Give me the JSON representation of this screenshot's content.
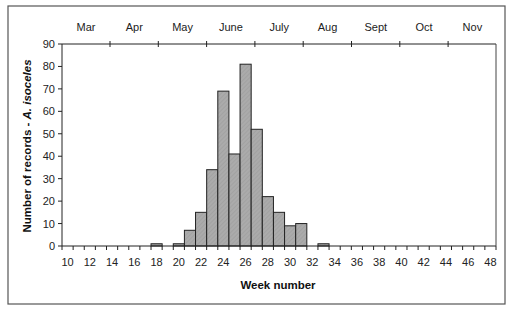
{
  "chart_data": {
    "type": "bar",
    "title": "",
    "xlabel": "Week number",
    "ylabel": "Number of records - ",
    "ylabel_italic": "A. isoceles",
    "ylim": [
      0,
      90
    ],
    "yticks": [
      0,
      10,
      20,
      30,
      40,
      50,
      60,
      70,
      80,
      90
    ],
    "grid": false,
    "legend": null,
    "categories": [
      10,
      11,
      12,
      13,
      14,
      15,
      16,
      17,
      18,
      19,
      20,
      21,
      22,
      23,
      24,
      25,
      26,
      27,
      28,
      29,
      30,
      31,
      32,
      33,
      34,
      35,
      36,
      37,
      38,
      39,
      40,
      41,
      42,
      43,
      44,
      45,
      46,
      47,
      48
    ],
    "xtick_labels": [
      "10",
      "12",
      "14",
      "16",
      "18",
      "20",
      "22",
      "24",
      "26",
      "28",
      "30",
      "32",
      "34",
      "36",
      "38",
      "40",
      "42",
      "44",
      "46",
      "48"
    ],
    "values": [
      0,
      0,
      0,
      0,
      0,
      0,
      0,
      0,
      1,
      0,
      1,
      7,
      15,
      34,
      69,
      41,
      81,
      52,
      22,
      15,
      9,
      10,
      0,
      1,
      0,
      0,
      0,
      0,
      0,
      0,
      0,
      0,
      0,
      0,
      0,
      0,
      0,
      0,
      0
    ],
    "secondary_x_axis": {
      "position": "top",
      "labels": [
        "Mar",
        "Apr",
        "May",
        "June",
        "July",
        "Aug",
        "Sept",
        "Oct",
        "Nov"
      ]
    },
    "bar_color": "#a9a9a9",
    "bar_edge_color": "#222222"
  }
}
